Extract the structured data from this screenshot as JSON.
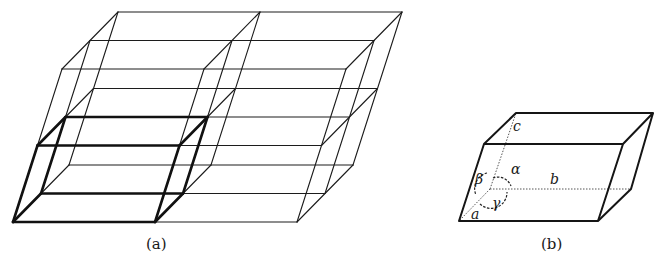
{
  "figure": {
    "panels": [
      {
        "id": "a",
        "caption": "(a)",
        "description": "Space lattice built from 2 x 2 x 2 unit cells, one unit cell outlined in bold",
        "lattice": {
          "cells_b": 2,
          "cells_a": 2,
          "cells_c": 2,
          "highlighted_cell": [
            0,
            0,
            0
          ]
        }
      },
      {
        "id": "b",
        "caption": "(b)",
        "description": "Single unit cell with axes and interaxial angles",
        "axis_labels": {
          "a": "a",
          "b": "b",
          "c": "c"
        },
        "angle_labels": {
          "alpha": "α",
          "beta": "β",
          "gamma": "γ"
        }
      }
    ]
  },
  "geometry": {
    "lattice_origin": [
      13,
      222
    ],
    "vec_b": [
      142,
      0
    ],
    "vec_depth": [
      28,
      -28.5
    ],
    "vec_c": [
      24.5,
      -76.5
    ],
    "colors": {
      "line": "#1c1c1c",
      "background": "#ffffff"
    }
  }
}
